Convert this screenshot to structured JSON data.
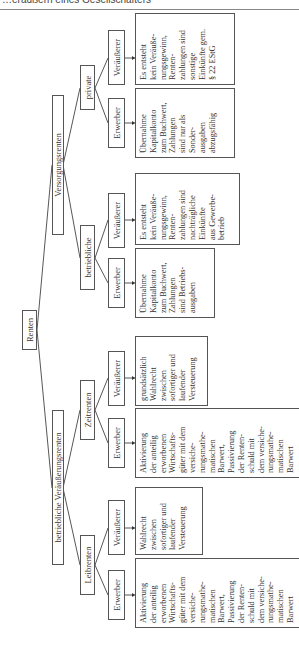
{
  "page_header": "…eräußern eines Gesellschafters",
  "diagram": {
    "root": "Renten",
    "branches": [
      {
        "label": "betriebliche Veräußerungsrenten",
        "children": [
          {
            "label": "Leibrenten",
            "leaves": [
              {
                "label": "Erwerber",
                "detail": "Aktivierung\nder anteilig\nerworbenen\nWirtschafts-\ngüter mit dem\nversiche-\nrungsmathe-\nmatischen\nBarwert,\nPassivierung\nder Renten-\nschuld mit\ndem versiche-\nrungsmathe-\nmatischen\nBarwert"
              },
              {
                "label": "Veräußerer",
                "detail": "Wahlrecht\nzwischen\nsofortiger und\nlaufender\nVersteuerung"
              }
            ]
          },
          {
            "label": "Zeitrenten",
            "leaves": [
              {
                "label": "Erwerber",
                "detail": "Aktivierung\nder anteilig\nerworbenen\nWirtschafts-\ngüter mit dem\nversiche-\nrungsmathe-\nmatischen\nBarwert,\nPassivierung\nder Renten-\nschuld mit\ndem versiche-\nrungsmathe-\nmatischen\nBarwert"
              },
              {
                "label": "Veräußerer",
                "detail": "grundsätzlich\nWahlrecht\nzwischen\nsofortiger und\nlaufender\nVersteuerung"
              }
            ]
          }
        ]
      },
      {
        "label": "Versorgungsrenten",
        "children": [
          {
            "label": "betriebliche",
            "leaves": [
              {
                "label": "Erwerber",
                "detail": "Übernahme\nKapitalkonto\nzum Buchwert,\nZahlungen\nsind Betriebs-\nausgaben"
              },
              {
                "label": "Veräußerer",
                "detail": "Es entsteht\nkein Veräuße-\nrungsgewinn,\nRenten-\nzahlungen sind\nnachträgliche\nEinkünfte\naus Gewerbe-\nbetrieb"
              }
            ]
          },
          {
            "label": "private",
            "leaves": [
              {
                "label": "Erwerber",
                "detail": "Übernahme\nKapitalkonto\nzum Buchwert,\nZahlungen\nsind nur als\nSonder-\nausgaben\nabzugsfähig"
              },
              {
                "label": "Veräußerer",
                "detail": "Es entsteht\nkein Veräuße-\nrungsgewinn,\nRenten-\nzahlungen sind\nsonstige\nEinkünfte gem.\n§ 22 EStG"
              }
            ]
          }
        ]
      }
    ]
  }
}
